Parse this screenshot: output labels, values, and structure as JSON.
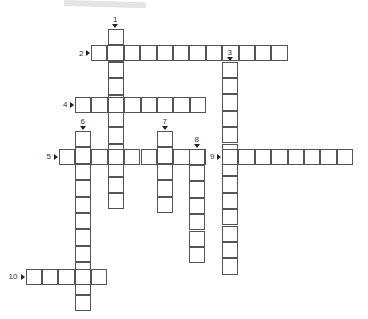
{
  "puzzle": {
    "cell_size": 16.4,
    "border_color": "#555555",
    "clues": [
      {
        "number": "1",
        "direction": "down",
        "x": 107.5,
        "y": 29,
        "length": 10.5
      },
      {
        "number": "2",
        "direction": "across",
        "x": 91,
        "y": 45,
        "length": 12
      },
      {
        "number": "3",
        "direction": "down",
        "x": 222,
        "y": 61.5,
        "length": 12.5
      },
      {
        "number": "4",
        "direction": "across",
        "x": 75,
        "y": 96.5,
        "length": 8
      },
      {
        "number": "5",
        "direction": "across",
        "x": 58.5,
        "y": 148.5,
        "length": 9
      },
      {
        "number": "6",
        "direction": "down",
        "x": 75,
        "y": 131,
        "length": 10.5
      },
      {
        "number": "7",
        "direction": "down",
        "x": 157,
        "y": 131,
        "length": 4.5
      },
      {
        "number": "8",
        "direction": "down",
        "x": 189,
        "y": 148.5,
        "length": 6.5
      },
      {
        "number": "9",
        "direction": "across",
        "x": 222,
        "y": 148.5,
        "length": 8
      },
      {
        "number": "10",
        "direction": "across",
        "x": 25.5,
        "y": 268.5,
        "length": 5
      }
    ]
  }
}
